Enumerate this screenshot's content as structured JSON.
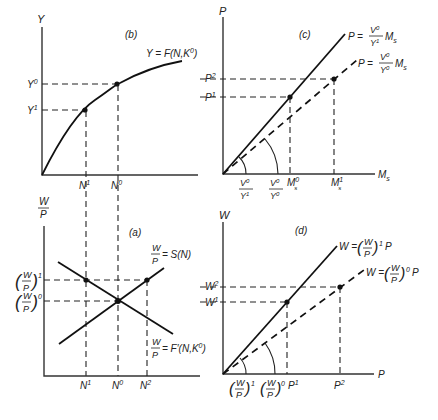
{
  "panels": {
    "b": {
      "label": "(b)",
      "y_axis": "Y",
      "curve_label": "Y = F(N,K",
      "curve_label_sup": "0",
      "curve_label_end": ")",
      "y_ticks": [
        {
          "base": "Y",
          "sup": "0"
        },
        {
          "base": "Y",
          "sup": "1"
        }
      ],
      "x_ticks": [
        {
          "base": "N",
          "sup": "1"
        },
        {
          "base": "N",
          "sup": "0"
        }
      ]
    },
    "c": {
      "label": "(c)",
      "y_axis": "P",
      "x_axis": "M",
      "x_axis_sub": "s",
      "solid_line": {
        "lhs": "P =",
        "num": "V",
        "num_sup": "0",
        "den": "Y",
        "den_sup": "1",
        "rhs": "M",
        "rhs_sub": "s"
      },
      "dashed_line": {
        "lhs": "P =",
        "num": "V",
        "num_sup": "0",
        "den": "Y",
        "den_sup": "0",
        "rhs": "M",
        "rhs_sub": "s"
      },
      "y_ticks": [
        {
          "base": "P",
          "sup": "2"
        },
        {
          "base": "P",
          "sup": "1"
        }
      ],
      "x_ticks": [
        {
          "num": "V",
          "num_sup": "0",
          "den": "Y",
          "den_sup": "1"
        },
        {
          "num": "V",
          "num_sup": "0",
          "den": "Y",
          "den_sup": "0"
        },
        {
          "base": "M",
          "sup": "0",
          "sub": "s"
        },
        {
          "base": "M",
          "sup": "1",
          "sub": "s"
        }
      ]
    },
    "a": {
      "label": "(a)",
      "y_axis_num": "W",
      "y_axis_den": "P",
      "supply_label": {
        "num": "W",
        "den": "P",
        "rhs": "= S(N)"
      },
      "demand_label": {
        "num": "W",
        "den": "P",
        "rhs": "= F′(N,K",
        "sup": "0",
        "end": ")"
      },
      "y_ticks": [
        {
          "num": "W",
          "den": "P",
          "sup": "1"
        },
        {
          "num": "W",
          "den": "P",
          "sup": "0"
        }
      ],
      "x_ticks": [
        {
          "base": "N",
          "sup": "1"
        },
        {
          "base": "N",
          "sup": "0"
        },
        {
          "base": "N",
          "sup": "2"
        }
      ]
    },
    "d": {
      "label": "(d)",
      "y_axis": "W",
      "x_axis": "P",
      "solid_line": {
        "lhs": "W =",
        "num": "W",
        "den": "P",
        "sup": "1",
        "rhs": "P"
      },
      "dashed_line": {
        "lhs": "W =",
        "num": "W",
        "den": "P",
        "sup": "0",
        "rhs": "P"
      },
      "y_ticks": [
        {
          "base": "W",
          "sup": "2"
        },
        {
          "base": "W",
          "sup": "1"
        }
      ],
      "x_ticks": [
        {
          "num": "W",
          "den": "P",
          "sup": "1"
        },
        {
          "num": "W",
          "den": "P",
          "sup": "0"
        },
        {
          "base": "P",
          "sup": "1"
        },
        {
          "base": "P",
          "sup": "2"
        }
      ]
    }
  }
}
